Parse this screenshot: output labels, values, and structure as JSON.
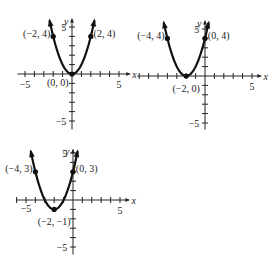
{
  "header_fragment": "",
  "chart_data": [
    {
      "type": "line",
      "title": "",
      "function": "y = x^2",
      "xlabel": "x",
      "ylabel": "y",
      "xlim": [
        -6,
        6
      ],
      "ylim": [
        -6,
        6
      ],
      "x_tick_labels": [
        "-5",
        "5"
      ],
      "y_tick_labels": [
        "5",
        "-5"
      ],
      "vertex": [
        0,
        0
      ],
      "points": [
        {
          "x": -2,
          "y": 4,
          "label": "(-2, 4)"
        },
        {
          "x": 2,
          "y": 4,
          "label": "(2, 4)"
        },
        {
          "x": 0,
          "y": 0,
          "label": "(0, 0)"
        }
      ]
    },
    {
      "type": "line",
      "title": "",
      "function": "y = (x + 2)^2",
      "xlabel": "x",
      "ylabel": "y",
      "xlim": [
        -6,
        6
      ],
      "ylim": [
        -6,
        6
      ],
      "x_tick_labels": [
        "5"
      ],
      "y_tick_labels": [
        "5",
        "-5"
      ],
      "vertex": [
        -2,
        0
      ],
      "points": [
        {
          "x": -4,
          "y": 4,
          "label": "(-4, 4)"
        },
        {
          "x": 0,
          "y": 4,
          "label": "(0, 4)"
        },
        {
          "x": -2,
          "y": 0,
          "label": "(-2, 0)"
        }
      ]
    },
    {
      "type": "line",
      "title": "",
      "function": "y = (x + 2)^2 - 1",
      "xlabel": "x",
      "ylabel": "y",
      "xlim": [
        -6,
        6
      ],
      "ylim": [
        -6,
        6
      ],
      "x_tick_labels": [
        "-5",
        "5"
      ],
      "y_tick_labels": [
        "5",
        "-5"
      ],
      "vertex": [
        -2,
        -1
      ],
      "points": [
        {
          "x": -4,
          "y": 3,
          "label": "(-4, 3)"
        },
        {
          "x": 0,
          "y": 3,
          "label": "(0, 3)"
        },
        {
          "x": -2,
          "y": -1,
          "label": "(-2, -1)"
        }
      ]
    }
  ]
}
